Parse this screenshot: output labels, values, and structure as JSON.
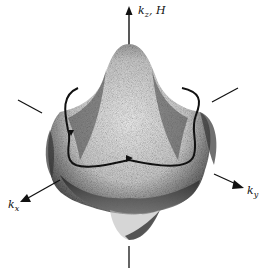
{
  "figure": {
    "type": "3D surface (Fermi surface) with orbit",
    "axes": {
      "z": {
        "label": "k",
        "subscript": "z",
        "suffix": ", H"
      },
      "x": {
        "label": "k",
        "subscript": "x"
      },
      "y": {
        "label": "k",
        "subscript": "y"
      }
    },
    "colors": {
      "ink": "#111111",
      "background": "#ffffff",
      "shade_dark": "#2a2a2a",
      "shade_mid": "#8a8a8a"
    }
  }
}
